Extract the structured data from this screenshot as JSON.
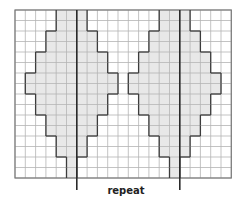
{
  "diagram": {
    "type": "knitting-chart",
    "grid": {
      "columns": 21,
      "rows": 16
    },
    "repeat_label": "repeat",
    "repeat_lines_after_columns": [
      5,
      15
    ],
    "motifs": [
      {
        "name": "left-diamond",
        "shaded_rows": [
          {
            "rows": [
              0,
              1
            ],
            "cols": [
              4,
              6
            ]
          },
          {
            "rows": [
              2,
              3
            ],
            "cols": [
              3,
              7
            ]
          },
          {
            "rows": [
              4,
              5
            ],
            "cols": [
              2,
              8
            ]
          },
          {
            "rows": [
              6,
              7
            ],
            "cols": [
              1,
              9
            ]
          },
          {
            "rows": [
              8,
              9
            ],
            "cols": [
              2,
              8
            ]
          },
          {
            "rows": [
              10,
              11
            ],
            "cols": [
              3,
              7
            ]
          },
          {
            "rows": [
              12,
              13
            ],
            "cols": [
              4,
              6
            ]
          },
          {
            "rows": [
              14,
              15
            ],
            "cols": [
              5,
              5
            ]
          }
        ]
      },
      {
        "name": "right-diamond",
        "shaded_rows": [
          {
            "rows": [
              0,
              1
            ],
            "cols": [
              14,
              16
            ]
          },
          {
            "rows": [
              2,
              3
            ],
            "cols": [
              13,
              17
            ]
          },
          {
            "rows": [
              4,
              5
            ],
            "cols": [
              12,
              18
            ]
          },
          {
            "rows": [
              6,
              7
            ],
            "cols": [
              11,
              19
            ]
          },
          {
            "rows": [
              8,
              9
            ],
            "cols": [
              12,
              18
            ]
          },
          {
            "rows": [
              10,
              11
            ],
            "cols": [
              13,
              17
            ]
          },
          {
            "rows": [
              12,
              13
            ],
            "cols": [
              14,
              16
            ]
          },
          {
            "rows": [
              14,
              15
            ],
            "cols": [
              15,
              15
            ]
          }
        ]
      }
    ],
    "colors": {
      "background": "#ffffff",
      "shade": "#e8e8e8",
      "gridline": "#b4b4b4",
      "border": "#7a7a7a",
      "outline": "#3c3c3c",
      "repeat_line": "#2a2a2a"
    }
  }
}
